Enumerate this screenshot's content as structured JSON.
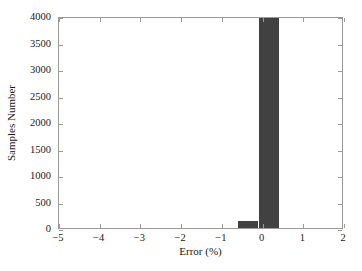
{
  "chart_data": {
    "type": "bar",
    "title": "",
    "subtitle": "",
    "xlabel": "Error (%)",
    "ylabel": "Samples Number",
    "xlim": [
      -5,
      2
    ],
    "ylim": [
      0,
      4000
    ],
    "grid": false,
    "legend": null,
    "bar_color": "#414141",
    "axis_color": "#9a9a9a",
    "background_color": "#ffffff",
    "bin_width": 0.5,
    "xticks": [
      -5,
      -4,
      -3,
      -2,
      -1,
      0,
      1,
      2
    ],
    "xtick_labels": [
      "−5",
      "−4",
      "−3",
      "−2",
      "−1",
      "0",
      "1",
      "2"
    ],
    "yticks": [
      0,
      500,
      1000,
      1500,
      2000,
      2500,
      3000,
      3500,
      4000
    ],
    "ytick_labels": [
      "0",
      "500",
      "1000",
      "1500",
      "2000",
      "2500",
      "3000",
      "3500",
      "4000"
    ],
    "bins": [
      {
        "x0": -0.6,
        "x1": -0.1,
        "value": 130
      },
      {
        "x0": -0.1,
        "x1": 0.4,
        "value": 3955
      }
    ],
    "categories": [
      "-0.35",
      "0.15"
    ],
    "values": [
      130,
      3955
    ]
  }
}
